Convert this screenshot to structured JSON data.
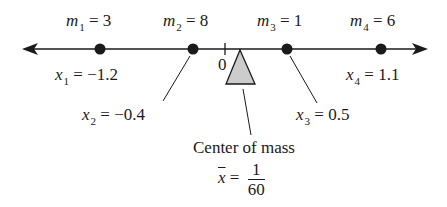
{
  "diagram": {
    "type": "number-line-center-of-mass",
    "colors": {
      "line": "#1a1a1a",
      "fulcrum_fill": "#cccccc",
      "background": "#ffffff"
    },
    "origin_label": "0",
    "masses": [
      {
        "mass_var": "m",
        "mass_sub": "1",
        "mass_value": "= 3",
        "pos_var": "x",
        "pos_sub": "1",
        "pos_value": "= −1.2"
      },
      {
        "mass_var": "m",
        "mass_sub": "2",
        "mass_value": "= 8",
        "pos_var": "x",
        "pos_sub": "2",
        "pos_value": "= −0.4"
      },
      {
        "mass_var": "m",
        "mass_sub": "3",
        "mass_value": "= 1",
        "pos_var": "x",
        "pos_sub": "3",
        "pos_value": "= 0.5"
      },
      {
        "mass_var": "m",
        "mass_sub": "4",
        "mass_value": "= 6",
        "pos_var": "x",
        "pos_sub": "4",
        "pos_value": "= 1.1"
      }
    ],
    "center_of_mass": {
      "label": "Center of mass",
      "symbol": "x",
      "equals": "=",
      "numerator": "1",
      "denominator": "60"
    }
  }
}
